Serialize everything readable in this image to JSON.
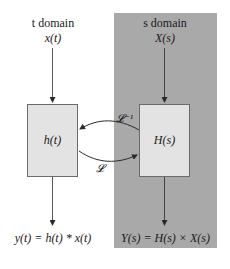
{
  "diagram": {
    "t_domain": {
      "title": "t domain",
      "input": "x(t)",
      "system": "h(t)",
      "output": "y(t) = h(t) * x(t)"
    },
    "s_domain": {
      "title": "s domain",
      "input": "X(s)",
      "system": "H(s)",
      "output": "Y(s) = H(s) × X(s)"
    },
    "transforms": {
      "forward": "𝓛",
      "inverse": "𝓛⁻¹"
    },
    "colors": {
      "s_panel": "#a9a9a9",
      "box_fill": "#e3e3e3",
      "box_border": "#6b6b6b",
      "arrow": "#2a2a2a"
    }
  }
}
